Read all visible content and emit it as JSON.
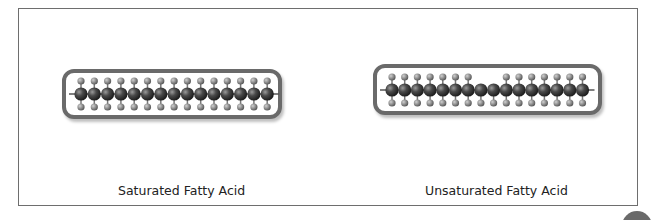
{
  "figure": {
    "panels": [
      {
        "id": "saturated",
        "label": "Saturated Fatty Acid",
        "carbon_count": 15,
        "missing_top_hydrogens": [],
        "capsule": {
          "x": 62,
          "y": 69,
          "w": 220,
          "h": 50
        },
        "chain": {
          "start_x": 81,
          "spacing": 13.3,
          "center_y": 94
        }
      },
      {
        "id": "unsaturated",
        "label": "Unsaturated Fatty Acid",
        "carbon_count": 16,
        "missing_top_hydrogens": [
          8,
          9
        ],
        "capsule": {
          "x": 373,
          "y": 64,
          "w": 229,
          "h": 51
        },
        "chain": {
          "start_x": 392,
          "spacing": 12.7,
          "center_y": 90
        }
      }
    ],
    "colors": {
      "frame": "#6e6e6e",
      "capsule_border": "#6a6a6a",
      "carbon": "#3a3a3a",
      "hydrogen": "#8a8a8a",
      "bond": "#555555"
    }
  }
}
